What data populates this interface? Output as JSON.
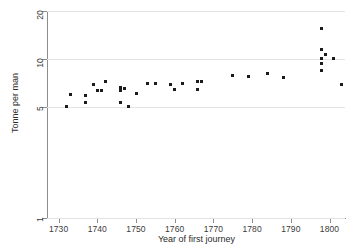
{
  "chart_data": {
    "type": "scatter",
    "title": "",
    "xlabel": "Year of first journey",
    "ylabel": "Tonne per man",
    "yscale": "log",
    "ylim": [
      1,
      20
    ],
    "xlim": [
      1727,
      1804
    ],
    "grid": true,
    "legend": null,
    "yticks": [
      1,
      5,
      10,
      20
    ],
    "ytick_labels": [
      "1",
      "5",
      "10",
      "20"
    ],
    "xticks": [
      1730,
      1740,
      1750,
      1760,
      1770,
      1780,
      1790,
      1800
    ],
    "xtick_labels": [
      "1730",
      "1740",
      "1750",
      "1760",
      "1770",
      "1780",
      "1790",
      "1800"
    ],
    "marker": "square",
    "marker_color": "#1b1b1b",
    "points": [
      {
        "x": 1732,
        "y": 5.0
      },
      {
        "x": 1733,
        "y": 6.0
      },
      {
        "x": 1737,
        "y": 5.9
      },
      {
        "x": 1737,
        "y": 5.3
      },
      {
        "x": 1739,
        "y": 6.9
      },
      {
        "x": 1740,
        "y": 6.3
      },
      {
        "x": 1741,
        "y": 6.3
      },
      {
        "x": 1742,
        "y": 7.2
      },
      {
        "x": 1746,
        "y": 6.6
      },
      {
        "x": 1746,
        "y": 6.5
      },
      {
        "x": 1746,
        "y": 6.4
      },
      {
        "x": 1746,
        "y": 6.3
      },
      {
        "x": 1746,
        "y": 5.3
      },
      {
        "x": 1747,
        "y": 6.5
      },
      {
        "x": 1748,
        "y": 5.0
      },
      {
        "x": 1750,
        "y": 6.1
      },
      {
        "x": 1753,
        "y": 7.0
      },
      {
        "x": 1755,
        "y": 7.0
      },
      {
        "x": 1759,
        "y": 6.9
      },
      {
        "x": 1760,
        "y": 6.4
      },
      {
        "x": 1762,
        "y": 7.0
      },
      {
        "x": 1766,
        "y": 7.2
      },
      {
        "x": 1766,
        "y": 6.4
      },
      {
        "x": 1767,
        "y": 7.2
      },
      {
        "x": 1775,
        "y": 7.9
      },
      {
        "x": 1779,
        "y": 7.8
      },
      {
        "x": 1784,
        "y": 8.1
      },
      {
        "x": 1788,
        "y": 7.6
      },
      {
        "x": 1798,
        "y": 15.5
      },
      {
        "x": 1798,
        "y": 11.5
      },
      {
        "x": 1798,
        "y": 10.0
      },
      {
        "x": 1798,
        "y": 9.4
      },
      {
        "x": 1798,
        "y": 8.5
      },
      {
        "x": 1799,
        "y": 10.7
      },
      {
        "x": 1801,
        "y": 10.0
      },
      {
        "x": 1803,
        "y": 6.9
      }
    ]
  }
}
